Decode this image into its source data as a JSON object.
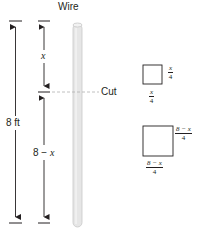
{
  "diagram": {
    "wire_label": "Wire",
    "total_length_label": "8 ft",
    "top_piece_label": "x",
    "bottom_piece_label_prefix": "8",
    "bottom_piece_label_op": "−",
    "bottom_piece_label_var": "x",
    "cut_label": "Cut",
    "small_square": {
      "side_right": {
        "num": "x",
        "den": "4"
      },
      "side_bottom": {
        "num": "x",
        "den": "4"
      }
    },
    "large_square": {
      "side_right": {
        "num": "8 − x",
        "den": "4"
      },
      "side_bottom": {
        "num": "8 − x",
        "den": "4"
      }
    },
    "colors": {
      "ink": "#231f20",
      "wire_fill": "#e6e6e6",
      "wire_edge": "#c8c8c8",
      "cut_line": "#b0b0b0"
    }
  }
}
